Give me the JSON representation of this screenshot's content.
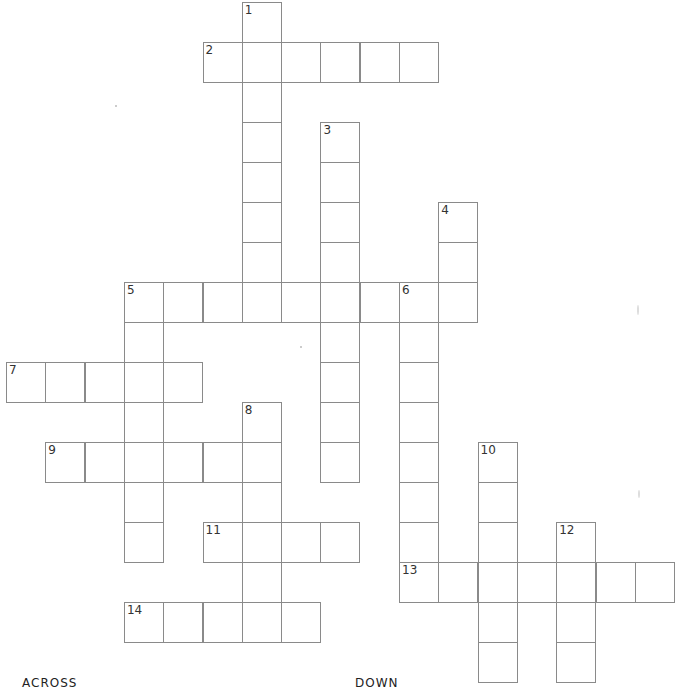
{
  "puzzle": {
    "cell_size": 39.3,
    "origin": {
      "x": 6,
      "y": 2
    },
    "row_height": 40,
    "entries": [
      {
        "number": "1",
        "direction": "down",
        "row": 0,
        "col": 6,
        "length": 8
      },
      {
        "number": "2",
        "direction": "across",
        "row": 1,
        "col": 5,
        "length": 6
      },
      {
        "number": "3",
        "direction": "down",
        "row": 3,
        "col": 8,
        "length": 9
      },
      {
        "number": "4",
        "direction": "down",
        "row": 5,
        "col": 11,
        "length": 3
      },
      {
        "number": "5",
        "direction": "across",
        "row": 7,
        "col": 3,
        "length": 9
      },
      {
        "number": "5",
        "direction": "down",
        "row": 7,
        "col": 3,
        "length": 7
      },
      {
        "number": "6",
        "direction": "down",
        "row": 7,
        "col": 10,
        "length": 8
      },
      {
        "number": "7",
        "direction": "across",
        "row": 9,
        "col": 0,
        "length": 5
      },
      {
        "number": "8",
        "direction": "down",
        "row": 10,
        "col": 6,
        "length": 6
      },
      {
        "number": "9",
        "direction": "across",
        "row": 11,
        "col": 1,
        "length": 6
      },
      {
        "number": "10",
        "direction": "down",
        "row": 11,
        "col": 12,
        "length": 6
      },
      {
        "number": "11",
        "direction": "across",
        "row": 13,
        "col": 5,
        "length": 4
      },
      {
        "number": "12",
        "direction": "down",
        "row": 13,
        "col": 14,
        "length": 4
      },
      {
        "number": "13",
        "direction": "across",
        "row": 14,
        "col": 10,
        "length": 7
      },
      {
        "number": "14",
        "direction": "across",
        "row": 15,
        "col": 3,
        "length": 5
      }
    ]
  },
  "headings": {
    "across": "ACROSS",
    "down": "DOWN"
  }
}
